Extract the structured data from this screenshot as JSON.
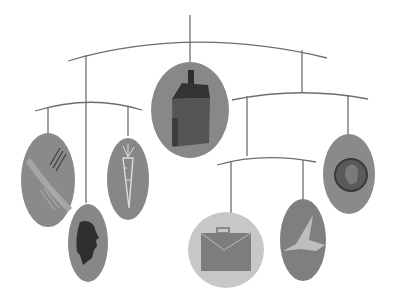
{
  "colors": {
    "background": "#ffffff",
    "wire": "#6e6e6e",
    "disc": "#8c8c8c",
    "disc_light": "#c8c8c8",
    "icon_dark": "#3a3a3a",
    "icon_light": "#d9d9d9"
  },
  "ornaments": [
    {
      "name": "hands",
      "label": "Hands"
    },
    {
      "name": "carrot",
      "label": "Carrot"
    },
    {
      "name": "head-profile",
      "label": "Head profile"
    },
    {
      "name": "house",
      "label": "House"
    },
    {
      "name": "briefcase",
      "label": "Briefcase"
    },
    {
      "name": "bird",
      "label": "Bird"
    },
    {
      "name": "coin",
      "label": "Coin"
    }
  ]
}
